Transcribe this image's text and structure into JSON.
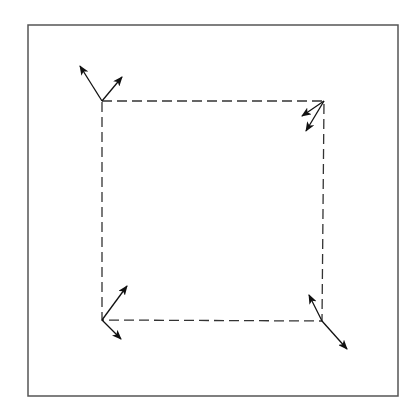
{
  "figure": {
    "width": 419,
    "height": 412,
    "background": "#ffffff",
    "frame": {
      "x": 28,
      "y": 25,
      "width": 370,
      "height": 371,
      "stroke": "#555555",
      "stroke_width": 1.5
    },
    "quad": {
      "stroke": "#333333",
      "stroke_width": 1.3,
      "dash": "10,5",
      "corners": {
        "top_left": [
          102,
          101
        ],
        "top_right": [
          324,
          101
        ],
        "bottom_right": [
          322,
          321
        ],
        "bottom_left": [
          102,
          320
        ]
      }
    },
    "arrow_color": "#111111",
    "arrows": [
      {
        "corner": "top_left",
        "from": [
          102,
          101
        ],
        "to": [
          80,
          66
        ]
      },
      {
        "corner": "top_left",
        "from": [
          102,
          101
        ],
        "to": [
          122,
          77
        ]
      },
      {
        "corner": "top_right",
        "from": [
          324,
          101
        ],
        "to": [
          302,
          116
        ]
      },
      {
        "corner": "top_right",
        "from": [
          324,
          101
        ],
        "to": [
          306,
          131
        ]
      },
      {
        "corner": "bottom_left",
        "from": [
          102,
          320
        ],
        "to": [
          127,
          286
        ]
      },
      {
        "corner": "bottom_left",
        "from": [
          102,
          320
        ],
        "to": [
          121,
          339
        ]
      },
      {
        "corner": "bottom_right",
        "from": [
          322,
          321
        ],
        "to": [
          309,
          295
        ]
      },
      {
        "corner": "bottom_right",
        "from": [
          322,
          321
        ],
        "to": [
          347,
          349
        ]
      }
    ]
  }
}
